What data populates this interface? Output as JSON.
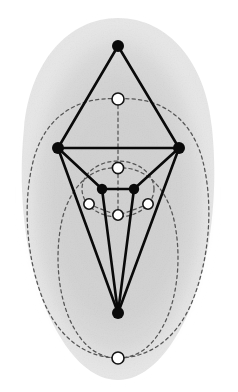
{
  "figure": {
    "width": 238,
    "height": 392,
    "background_color": "#ffffff",
    "blob_fill_color": "#d2d2d2",
    "edge_color": "#000000",
    "dashed_curve_color": "#555555",
    "filled_vertex_color": "#000000",
    "hollow_vertex_fill": "#ffffff",
    "hollow_vertex_stroke": "#000000"
  },
  "chart_data": {
    "type": "diagram",
    "xlabel": "",
    "ylabel": "",
    "xlim": [
      0,
      238
    ],
    "ylim": [
      0,
      392
    ],
    "grid": false,
    "legend": "none",
    "filled_vertices": [
      {
        "id": "top-apex",
        "x": 118,
        "y": 46,
        "r": 6.0
      },
      {
        "id": "left-hub",
        "x": 58,
        "y": 148,
        "r": 6.0
      },
      {
        "id": "right-hub",
        "x": 179,
        "y": 148,
        "r": 6.0
      },
      {
        "id": "inner-left",
        "x": 102,
        "y": 189,
        "r": 5.2
      },
      {
        "id": "inner-right",
        "x": 134,
        "y": 189,
        "r": 5.2
      },
      {
        "id": "bottom-apex",
        "x": 118,
        "y": 313,
        "r": 6.0
      }
    ],
    "hollow_vertices": [
      {
        "id": "upper-face",
        "x": 118,
        "y": 99,
        "r": 6.0
      },
      {
        "id": "mid-face",
        "x": 118,
        "y": 168,
        "r": 5.6
      },
      {
        "id": "left-face",
        "x": 89,
        "y": 204,
        "r": 5.2
      },
      {
        "id": "right-face",
        "x": 148,
        "y": 204,
        "r": 5.2
      },
      {
        "id": "inner-face",
        "x": 118,
        "y": 215,
        "r": 5.2
      },
      {
        "id": "outer-face",
        "x": 118,
        "y": 358,
        "r": 6.0
      }
    ],
    "solid_edges": [
      {
        "from": "top-apex",
        "to": "left-hub"
      },
      {
        "from": "top-apex",
        "to": "right-hub"
      },
      {
        "from": "left-hub",
        "to": "right-hub"
      },
      {
        "from": "left-hub",
        "to": "inner-left"
      },
      {
        "from": "right-hub",
        "to": "inner-right"
      },
      {
        "from": "inner-left",
        "to": "inner-right"
      },
      {
        "from": "left-hub",
        "to": "bottom-apex"
      },
      {
        "from": "right-hub",
        "to": "bottom-apex"
      },
      {
        "from": "inner-left",
        "to": "bottom-apex"
      },
      {
        "from": "inner-right",
        "to": "bottom-apex"
      }
    ],
    "dashed_curve_count": 5
  }
}
